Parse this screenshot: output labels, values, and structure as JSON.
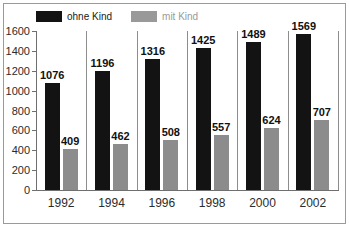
{
  "chart_data": {
    "type": "bar",
    "title": "",
    "xlabel": "",
    "ylabel": "",
    "ylim": [
      0,
      1600
    ],
    "yticks": [
      0,
      200,
      400,
      600,
      800,
      1000,
      1200,
      1400,
      1600
    ],
    "ytick_labels": [
      "0",
      "200",
      "400",
      "600",
      "800",
      "1000",
      "1200",
      "1400",
      "1600"
    ],
    "grid": false,
    "legend_position": "top-left",
    "categories": [
      "1992",
      "1994",
      "1996",
      "1998",
      "2000",
      "2002"
    ],
    "series": [
      {
        "name": "ohne Kind",
        "color": "#131313",
        "values": [
          1076,
          1196,
          1316,
          1425,
          1489,
          1569
        ],
        "labels": [
          "1076",
          "1196",
          "1316",
          "1425",
          "1489",
          "1569"
        ]
      },
      {
        "name": "mit Kind",
        "color": "#8c8c8c",
        "values": [
          409,
          462,
          508,
          557,
          624,
          707
        ],
        "labels": [
          "409",
          "462",
          "508",
          "557",
          "624",
          "707"
        ]
      }
    ]
  },
  "legend": {
    "items": [
      {
        "label": "ohne Kind",
        "swatch": "dark"
      },
      {
        "label": "mit Kind",
        "swatch": "gray"
      }
    ]
  },
  "colors": {
    "series_dark": "#131313",
    "series_gray": "#8c8c8c",
    "axis": "#6f6f6f",
    "separator": "#8d8d8d",
    "frame": "#9a9a9a",
    "background": "#ffffff"
  }
}
